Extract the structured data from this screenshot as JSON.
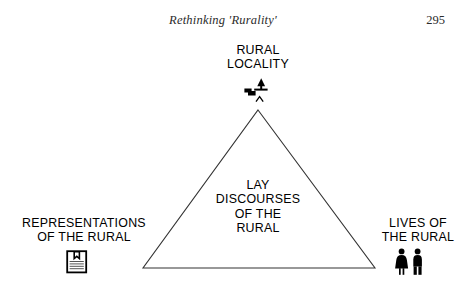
{
  "header": {
    "title": "Rethinking 'Rurality'",
    "page_number": "295"
  },
  "diagram": {
    "apex": {
      "line1": "RURAL",
      "line2": "LOCALITY",
      "icon": "rural-scene-icon"
    },
    "centre": {
      "line1": "LAY",
      "line2": "DISCOURSES",
      "line3": "OF THE",
      "line4": "RURAL"
    },
    "left": {
      "line1": "REPRESENTATIONS",
      "line2": "OF THE RURAL",
      "icon": "book-icon"
    },
    "right": {
      "line1": "LIVES OF",
      "line2": "THE RURAL",
      "icon": "people-icon"
    },
    "colors": {
      "stroke": "#333333",
      "text": "#000000",
      "background": "#ffffff",
      "header_text": "#2b2b2b"
    },
    "geometry": {
      "apex_x": 258,
      "apex_y": 110,
      "bottom_left_x": 143,
      "bottom_left_y": 268,
      "bottom_right_x": 375,
      "bottom_right_y": 268,
      "stroke_width": 1
    }
  }
}
